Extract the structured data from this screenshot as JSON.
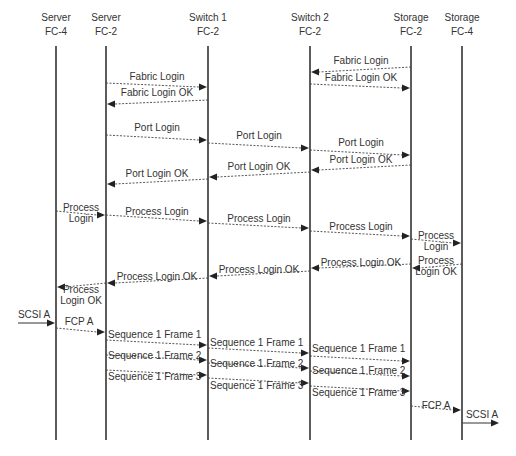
{
  "participants": [
    {
      "id": "srv4",
      "line1": "Server",
      "line2": "FC-4"
    },
    {
      "id": "srv2",
      "line1": "Server",
      "line2": "FC-2"
    },
    {
      "id": "sw1",
      "line1": "Switch 1",
      "line2": "FC-2"
    },
    {
      "id": "sw2",
      "line1": "Switch 2",
      "line2": "FC-2"
    },
    {
      "id": "sto2",
      "line1": "Storage",
      "line2": "FC-2"
    },
    {
      "id": "sto4",
      "line1": "Storage",
      "line2": "FC-4"
    }
  ],
  "messages": [
    {
      "from": "sto2",
      "to": "sw2",
      "label": [
        "Fabric Login"
      ],
      "style": "dashed"
    },
    {
      "from": "srv2",
      "to": "sw1",
      "label": [
        "Fabric Login"
      ],
      "style": "dashed"
    },
    {
      "from": "sw2",
      "to": "sto2",
      "label": [
        "Fabric Login OK"
      ],
      "style": "dashed"
    },
    {
      "from": "sw1",
      "to": "srv2",
      "label": [
        "Fabric Login OK"
      ],
      "style": "dashed"
    },
    {
      "from": "srv2",
      "to": "sw1",
      "label": [
        "Port Login"
      ],
      "style": "dashed"
    },
    {
      "from": "sw1",
      "to": "sw2",
      "label": [
        "Port Login"
      ],
      "style": "dashed"
    },
    {
      "from": "sw2",
      "to": "sto2",
      "label": [
        "Port Login"
      ],
      "style": "dashed"
    },
    {
      "from": "sto2",
      "to": "sw2",
      "label": [
        "Port Login OK"
      ],
      "style": "dashed"
    },
    {
      "from": "sw2",
      "to": "sw1",
      "label": [
        "Port Login OK"
      ],
      "style": "dashed"
    },
    {
      "from": "sw1",
      "to": "srv2",
      "label": [
        "Port Login OK"
      ],
      "style": "dashed"
    },
    {
      "from": "srv4",
      "to": "srv2",
      "label": [
        "Process",
        "Login"
      ],
      "style": "dashed"
    },
    {
      "from": "srv2",
      "to": "sw1",
      "label": [
        "Process Login"
      ],
      "style": "dashed"
    },
    {
      "from": "sw1",
      "to": "sw2",
      "label": [
        "Process Login"
      ],
      "style": "dashed"
    },
    {
      "from": "sw2",
      "to": "sto2",
      "label": [
        "Process Login"
      ],
      "style": "dashed"
    },
    {
      "from": "sto2",
      "to": "sto4",
      "label": [
        "Process",
        "Login"
      ],
      "style": "dashed"
    },
    {
      "from": "sto4",
      "to": "sto2",
      "label": [
        "Process",
        "Login OK"
      ],
      "style": "dashed"
    },
    {
      "from": "sto2",
      "to": "sw2",
      "label": [
        "Process Login OK"
      ],
      "style": "dashed"
    },
    {
      "from": "sw2",
      "to": "sw1",
      "label": [
        "Process Login OK"
      ],
      "style": "dashed"
    },
    {
      "from": "sw1",
      "to": "srv2",
      "label": [
        "Process Login OK"
      ],
      "style": "dashed"
    },
    {
      "from": "srv2",
      "to": "srv4",
      "label": [
        "Process",
        "Login OK"
      ],
      "style": "dashed"
    },
    {
      "from": "external-left",
      "to": "srv4",
      "label": [
        "SCSI A"
      ],
      "style": "solid"
    },
    {
      "from": "srv4",
      "to": "srv2",
      "label": [
        "FCP A"
      ],
      "style": "dashed"
    },
    {
      "from": "srv2",
      "to": "sw1",
      "label": [
        "Sequence 1 Frame 1"
      ],
      "style": "dashed"
    },
    {
      "from": "srv2",
      "to": "sw1",
      "label": [
        "Sequence 1 Frame 2"
      ],
      "style": "dashed"
    },
    {
      "from": "srv2",
      "to": "sw1",
      "label": [
        "Sequence 1 Frame 3"
      ],
      "style": "dashed"
    },
    {
      "from": "sw1",
      "to": "sw2",
      "label": [
        "Sequence 1 Frame 1"
      ],
      "style": "dashed"
    },
    {
      "from": "sw1",
      "to": "sw2",
      "label": [
        "Sequence 1 Frame 2"
      ],
      "style": "dashed"
    },
    {
      "from": "sw1",
      "to": "sw2",
      "label": [
        "Sequence 1 Frame 3"
      ],
      "style": "dashed"
    },
    {
      "from": "sw2",
      "to": "sto2",
      "label": [
        "Sequence 1 Frame 1"
      ],
      "style": "dashed"
    },
    {
      "from": "sw2",
      "to": "sto2",
      "label": [
        "Sequence 1 Frame 2"
      ],
      "style": "dashed"
    },
    {
      "from": "sw2",
      "to": "sto2",
      "label": [
        "Sequence 1 Frame 3"
      ],
      "style": "dashed"
    },
    {
      "from": "sto2",
      "to": "sto4",
      "label": [
        "FCP A"
      ],
      "style": "dashed"
    },
    {
      "from": "sto4",
      "to": "external-right",
      "label": [
        "SCSI A"
      ],
      "style": "solid"
    }
  ]
}
